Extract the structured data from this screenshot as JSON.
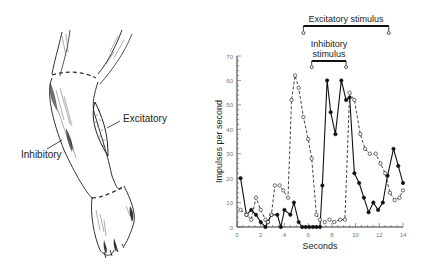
{
  "illustration": {
    "labels": {
      "excitatory": "Excitatory",
      "inhibitory": "Inhibitory"
    }
  },
  "chart_data": {
    "type": "line",
    "title": "",
    "xlabel": "Seconds",
    "ylabel": "Impulses per second",
    "xlim": [
      0,
      14
    ],
    "ylim": [
      0,
      70
    ],
    "x_ticks": [
      0,
      2,
      4,
      6,
      8,
      10,
      12,
      14
    ],
    "y_ticks": [
      0,
      10,
      20,
      30,
      40,
      50,
      60,
      70
    ],
    "grid": false,
    "annotations": [
      {
        "label": "Excitatory stimulus",
        "start": 5.6,
        "end": 12.8
      },
      {
        "label_line1": "Inhibitory",
        "label_line2": "stimulus",
        "start": 6.3,
        "end": 9.2
      }
    ],
    "series": [
      {
        "name": "filled-circles (solid line)",
        "marker": "filled",
        "x": [
          0.3,
          0.8,
          1.2,
          1.6,
          2.0,
          2.4,
          2.6,
          2.9,
          3.4,
          3.7,
          4.0,
          4.5,
          4.8,
          5.2,
          5.5,
          5.8,
          6.1,
          6.4,
          6.7,
          7.0,
          7.2,
          7.6,
          7.9,
          8.3,
          8.8,
          9.2,
          9.5,
          9.9,
          10.3,
          10.7,
          11.1,
          11.5,
          11.9,
          12.3,
          12.7,
          13.2,
          13.6,
          14.0
        ],
        "y": [
          20,
          5,
          7,
          5,
          2,
          0,
          2,
          5,
          5,
          0,
          7,
          5,
          10,
          2,
          0,
          0,
          0,
          0,
          0,
          0,
          17,
          60,
          47,
          38,
          60,
          52,
          53,
          22,
          18,
          12,
          6,
          10,
          7,
          10,
          21,
          32,
          25,
          18
        ]
      },
      {
        "name": "open-circles (dashed line)",
        "marker": "open",
        "x": [
          0.3,
          0.8,
          1.2,
          1.6,
          2.0,
          2.4,
          2.6,
          2.9,
          3.2,
          3.6,
          3.9,
          4.3,
          4.6,
          4.9,
          5.2,
          5.6,
          6.0,
          6.3,
          6.7,
          7.0,
          7.4,
          7.8,
          8.2,
          8.7,
          9.1,
          9.5,
          9.9,
          10.4,
          10.8,
          11.2,
          11.7,
          12.1,
          12.5,
          12.9,
          13.3,
          13.7,
          14.0
        ],
        "y": [
          7,
          5,
          3,
          12,
          7,
          3,
          2,
          5,
          17,
          17,
          15,
          12,
          52,
          62,
          57,
          45,
          36,
          28,
          5,
          3,
          2,
          3,
          2,
          3,
          3,
          55,
          52,
          38,
          32,
          30,
          30,
          26,
          22,
          14,
          11,
          12,
          15
        ]
      }
    ]
  }
}
